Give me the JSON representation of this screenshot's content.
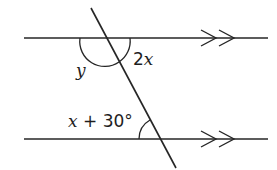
{
  "diagram": {
    "colors": {
      "line": "#262626",
      "text": "#1e1e1e",
      "background": "#ffffff"
    },
    "lines": {
      "top_parallel": {
        "x1": 24,
        "y1": 38,
        "x2": 268,
        "y2": 38
      },
      "bottom_parallel": {
        "x1": 24,
        "y1": 139,
        "x2": 268,
        "y2": 139
      },
      "transversal": {
        "x1": 91,
        "y1": 8,
        "x2": 176,
        "y2": 168
      }
    },
    "parallel_markers": "double-arrow",
    "labels": {
      "angle_y": "y",
      "angle_2x_coef": "2",
      "angle_2x_var": "x",
      "angle_bottom_var": "x",
      "angle_bottom_rest": " + 30°"
    }
  }
}
